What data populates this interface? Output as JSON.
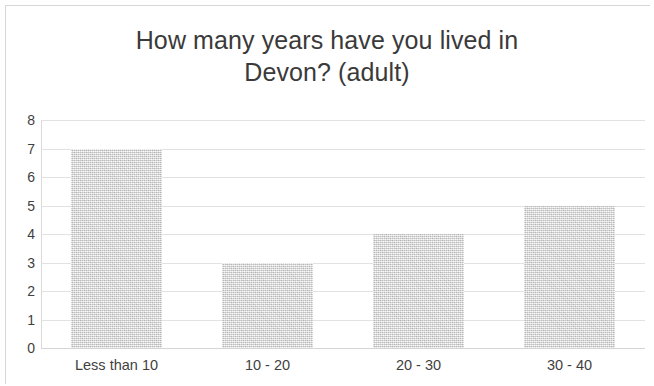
{
  "chart_data": {
    "type": "bar",
    "title_line1": "How many years have you lived in",
    "title_line2": "Devon? (adult)",
    "xlabel": "",
    "ylabel": "",
    "categories": [
      "Less than 10",
      "10 - 20",
      "20 - 30",
      "30 - 40"
    ],
    "values": [
      7,
      3,
      4,
      5
    ],
    "ylim": [
      0,
      8
    ],
    "ytick_labels": [
      "8",
      "7",
      "6",
      "5",
      "4",
      "3",
      "2",
      "1",
      "0"
    ],
    "ytick_values": [
      8,
      7,
      6,
      5,
      4,
      3,
      2,
      1,
      0
    ],
    "grid": true,
    "legend": "none",
    "bar_color": "#d2d2d2",
    "gridline_color": "#e2e2e2",
    "text_color": "#3f3f3f",
    "title_color": "#3a3a3a",
    "background_color": "#ffffff"
  }
}
